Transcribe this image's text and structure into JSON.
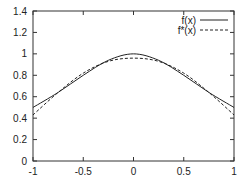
{
  "chart_data": {
    "type": "line",
    "title": "",
    "xlabel": "",
    "ylabel": "",
    "xlim": [
      -1,
      1
    ],
    "ylim": [
      0,
      1.4
    ],
    "grid": false,
    "legend_position": "top-right",
    "x_ticks": [
      "-1",
      "-0.5",
      "0",
      "0.5",
      "1"
    ],
    "y_ticks": [
      "0",
      "0.2",
      "0.4",
      "0.6",
      "0.8",
      "1",
      "1.2",
      "1.4"
    ],
    "x": [
      -1,
      -0.75,
      -0.5,
      -0.25,
      0,
      0.25,
      0.5,
      0.75,
      1
    ],
    "series": [
      {
        "name": "f(x)",
        "style": "solid",
        "values": [
          0.5,
          0.64,
          0.8,
          0.94,
          1.0,
          0.94,
          0.8,
          0.64,
          0.5
        ]
      },
      {
        "name": "f*(x)",
        "style": "dashed",
        "values": [
          0.43,
          0.64,
          0.82,
          0.93,
          0.96,
          0.93,
          0.82,
          0.64,
          0.43
        ]
      }
    ]
  }
}
